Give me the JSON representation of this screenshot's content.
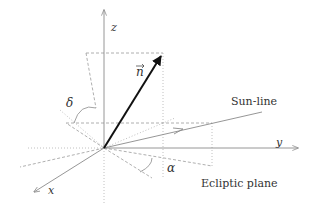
{
  "diagram": {
    "labels": {
      "z_axis": "z",
      "y_axis": "y",
      "x_axis": "x",
      "normal_vector": "n",
      "delta_angle": "δ",
      "alpha_angle": "α",
      "sun_line": "Sun-line",
      "ecliptic_plane": "Ecliptic plane"
    },
    "colors": {
      "axis": "#8a8a8a",
      "vector": "#111111",
      "dashed": "#9a9a9a",
      "text": "#333333"
    }
  }
}
